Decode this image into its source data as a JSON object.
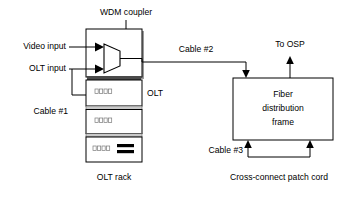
{
  "diagram": {
    "background_color": "#ffffff",
    "line_color": "#000000",
    "shadow_color": "#9a9a9a",
    "shelf_bar_color": "#c9c9c9"
  },
  "labels": {
    "wdm_coupler": "WDM  coupler",
    "video_input": "Video input",
    "olt_input": "OLT input",
    "cable_1": "Cable #1",
    "cable_2": "Cable #2",
    "cable_3": "Cable #3",
    "olt": "OLT",
    "olt_rack": "OLT rack",
    "to_osp": "To OSP",
    "cross_connect": "Cross-connect patch cord"
  },
  "fiber_distribution_frame": {
    "line1": "Fiber",
    "line2": "distribution",
    "line3": "frame"
  },
  "rack": {
    "shelves": [
      {
        "ports": 4,
        "has_black_bars": false
      },
      {
        "ports": 4,
        "has_black_bars": false
      },
      {
        "ports": 4,
        "has_black_bars": true
      }
    ]
  },
  "icons": {
    "wdm_coupler_symbol": "trapezoid-multiplexer-icon",
    "arrow_down": "arrow-down-icon",
    "arrow_up": "arrow-up-icon",
    "arrow_right": "arrow-right-icon"
  }
}
